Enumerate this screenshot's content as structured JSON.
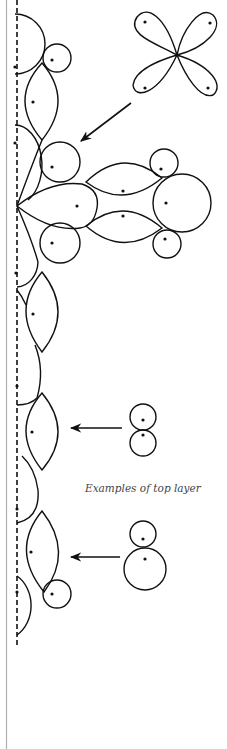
{
  "diagram": {
    "caption": "Examples of top layer",
    "colors": {
      "ink": "#111111",
      "caption": "#444444",
      "border": "#b0b0b0",
      "background": "#ffffff"
    },
    "elements": [
      {
        "name": "axis",
        "kind": "dashed vertical line"
      },
      {
        "name": "four-lobe-flower",
        "kind": "example shape",
        "lobes": 4
      },
      {
        "name": "branching-cluster",
        "kind": "layer arrangement"
      },
      {
        "name": "snowman-equal",
        "kind": "example shape",
        "circles": 2
      },
      {
        "name": "snowman-unequal",
        "kind": "example shape",
        "circles": 2
      }
    ],
    "arrows": [
      {
        "name": "arrow-flower-to-cluster",
        "from": "four-lobe-flower",
        "to": "branching-cluster"
      },
      {
        "name": "arrow-equal-circles-to-lens",
        "from": "snowman-equal",
        "to": "lens"
      },
      {
        "name": "arrow-unequal-circles-to-lens",
        "from": "snowman-unequal",
        "to": "lens"
      }
    ]
  }
}
